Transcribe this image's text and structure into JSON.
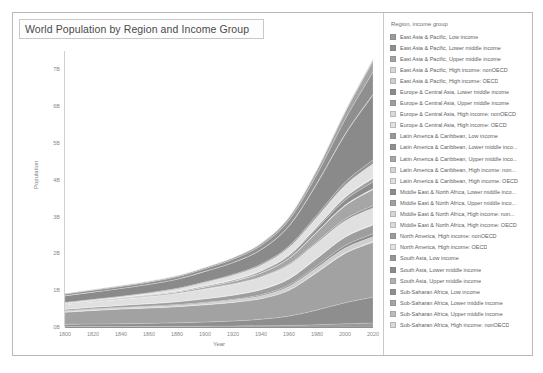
{
  "chart_data": {
    "type": "area",
    "stacked": true,
    "title": "World Population by Region and Income Group",
    "xlabel": "Year",
    "ylabel": "Population",
    "xlim": [
      1800,
      2020
    ],
    "ylim": [
      0,
      7500000000
    ],
    "grid": false,
    "legend_position": "right",
    "legend_title": "Region, income group",
    "x_ticks": [
      "1800",
      "1820",
      "1840",
      "1860",
      "1880",
      "1900",
      "1920",
      "1940",
      "1960",
      "1980",
      "2000",
      "2020"
    ],
    "x_tick_values": [
      1800,
      1820,
      1840,
      1860,
      1880,
      1900,
      1920,
      1940,
      1960,
      1980,
      2000,
      2020
    ],
    "y_ticks": [
      "0B",
      "1B",
      "2B",
      "3B",
      "4B",
      "5B",
      "6B",
      "7B"
    ],
    "y_tick_values": [
      0,
      1000000000,
      2000000000,
      3000000000,
      4000000000,
      5000000000,
      6000000000,
      7000000000
    ],
    "x": [
      1800,
      1820,
      1840,
      1860,
      1880,
      1900,
      1920,
      1940,
      1960,
      1980,
      2000,
      2020
    ],
    "series": [
      {
        "name": "East Asia & Pacific, Low income",
        "color": "#9a9a9a",
        "values": [
          12000000,
          13500000,
          15000000,
          17000000,
          19000000,
          22000000,
          26000000,
          32000000,
          42000000,
          62000000,
          88000000,
          112000000
        ]
      },
      {
        "name": "East Asia & Pacific, Lower middle income",
        "color": "#8e8e8e",
        "values": [
          60000000,
          66000000,
          73000000,
          82000000,
          94000000,
          112000000,
          138000000,
          178000000,
          255000000,
          400000000,
          570000000,
          700000000
        ]
      },
      {
        "name": "East Asia & Pacific, Upper middle income",
        "color": "#a2a2a2",
        "values": [
          330000000,
          370000000,
          400000000,
          420000000,
          440000000,
          470000000,
          505000000,
          560000000,
          700000000,
          1020000000,
          1340000000,
          1490000000
        ]
      },
      {
        "name": "East Asia & Pacific, High income: nonOECD",
        "color": "#d8d8d8",
        "values": [
          2000000,
          2300000,
          2600000,
          3000000,
          3600000,
          4400000,
          5500000,
          7000000,
          10000000,
          15000000,
          20000000,
          24000000
        ]
      },
      {
        "name": "East Asia & Pacific, High income: OECD",
        "color": "#cfcfcf",
        "values": [
          30000000,
          32000000,
          33000000,
          34000000,
          37000000,
          45000000,
          56000000,
          73000000,
          94000000,
          117000000,
          127000000,
          126000000
        ]
      },
      {
        "name": "Europe & Central Asia, Lower middle income",
        "color": "#8b8b8b",
        "values": [
          8000000,
          9500000,
          11000000,
          13000000,
          15500000,
          19000000,
          23000000,
          29000000,
          38000000,
          52000000,
          68000000,
          82000000
        ]
      },
      {
        "name": "Europe & Central Asia, Upper middle income",
        "color": "#9e9e9e",
        "values": [
          38000000,
          44000000,
          52000000,
          62000000,
          74000000,
          92000000,
          108000000,
          133000000,
          165000000,
          200000000,
          225000000,
          240000000
        ]
      },
      {
        "name": "Europe & Central Asia, High income: nonOECD",
        "color": "#dadada",
        "values": [
          4000000,
          4600000,
          5200000,
          6000000,
          7000000,
          8400000,
          9500000,
          11000000,
          13000000,
          15500000,
          17000000,
          18000000
        ]
      },
      {
        "name": "Europe & Central Asia, High income: OECD",
        "color": "#e0e0e0",
        "values": [
          130000000,
          146000000,
          166000000,
          190000000,
          220000000,
          260000000,
          290000000,
          330000000,
          370000000,
          405000000,
          425000000,
          440000000
        ]
      },
      {
        "name": "Latin America & Caribbean, Low income",
        "color": "#999999",
        "values": [
          800000,
          900000,
          1000000,
          1200000,
          1400000,
          1700000,
          2100000,
          2800000,
          4000000,
          6000000,
          8500000,
          11000000
        ]
      },
      {
        "name": "Latin America & Caribbean, Lower middle inco...",
        "color": "#909090",
        "values": [
          3000000,
          3400000,
          3900000,
          4600000,
          5600000,
          7000000,
          9000000,
          13000000,
          20000000,
          32000000,
          45000000,
          56000000
        ]
      },
      {
        "name": "Latin America & Caribbean, Upper middle inco...",
        "color": "#a6a6a6",
        "values": [
          15000000,
          18000000,
          22000000,
          28000000,
          36000000,
          48000000,
          68000000,
          100000000,
          155000000,
          255000000,
          360000000,
          440000000
        ]
      },
      {
        "name": "Latin America & Caribbean, High income: non...",
        "color": "#d5d5d5",
        "values": [
          500000,
          600000,
          700000,
          850000,
          1050000,
          1300000,
          1700000,
          2300000,
          3200000,
          4600000,
          6200000,
          7400000
        ]
      },
      {
        "name": "Latin America & Caribbean, High income: OECD",
        "color": "#dedede",
        "values": [
          700000,
          850000,
          1000000,
          1300000,
          1700000,
          2400000,
          3500000,
          5200000,
          7800000,
          11500000,
          15500000,
          19000000
        ]
      },
      {
        "name": "Middle East & North Africa, Lower middle inco...",
        "color": "#8c8c8c",
        "values": [
          10000000,
          11000000,
          12500000,
          14500000,
          17000000,
          21000000,
          26000000,
          35000000,
          52000000,
          85000000,
          130000000,
          175000000
        ]
      },
      {
        "name": "Middle East & North Africa, Upper middle inco...",
        "color": "#a0a0a0",
        "values": [
          6000000,
          6700000,
          7500000,
          8600000,
          10000000,
          12500000,
          15500000,
          21000000,
          31000000,
          50000000,
          76000000,
          100000000
        ]
      },
      {
        "name": "Middle East & North Africa, High income: non...",
        "color": "#d7d7d7",
        "values": [
          400000,
          450000,
          520000,
          600000,
          720000,
          900000,
          1200000,
          1700000,
          2600000,
          5000000,
          10000000,
          17000000
        ]
      },
      {
        "name": "Middle East & North Africa, High income: OECD",
        "color": "#dcdcdc",
        "values": [
          300000,
          340000,
          390000,
          450000,
          540000,
          680000,
          870000,
          1200000,
          1800000,
          2800000,
          4000000,
          5200000
        ]
      },
      {
        "name": "North America, High income: nonOECD",
        "color": "#9c9c9c",
        "values": [
          200000,
          240000,
          290000,
          350000,
          430000,
          540000,
          700000,
          950000,
          1300000,
          1800000,
          2300000,
          2700000
        ]
      },
      {
        "name": "North America, High income: OECD",
        "color": "#e2e2e2",
        "values": [
          7000000,
          10500000,
          17500000,
          32000000,
          51000000,
          82000000,
          117000000,
          144000000,
          199000000,
          252000000,
          313000000,
          368000000
        ]
      },
      {
        "name": "South Asia, Low income",
        "color": "#969696",
        "values": [
          10000000,
          11000000,
          12500000,
          14000000,
          16000000,
          19000000,
          23000000,
          29000000,
          39000000,
          58000000,
          85000000,
          110000000
        ]
      },
      {
        "name": "South Asia, Lower middle income",
        "color": "#8a8a8a",
        "values": [
          180000000,
          195000000,
          210000000,
          225000000,
          245000000,
          280000000,
          320000000,
          390000000,
          540000000,
          850000000,
          1290000000,
          1760000000
        ]
      },
      {
        "name": "South Asia, Upper middle income",
        "color": "#b0b0b0",
        "values": [
          1500000,
          1700000,
          1900000,
          2200000,
          2600000,
          3200000,
          4000000,
          5200000,
          7500000,
          12000000,
          18000000,
          23000000
        ]
      },
      {
        "name": "Sub-Saharan Africa, Low income",
        "color": "#8f8f8f",
        "values": [
          45000000,
          48000000,
          52000000,
          57000000,
          63000000,
          73000000,
          88000000,
          112000000,
          155000000,
          240000000,
          390000000,
          600000000
        ]
      },
      {
        "name": "Sub-Saharan Africa, Lower middle income",
        "color": "#a4a4a4",
        "values": [
          20000000,
          21500000,
          23500000,
          26000000,
          29000000,
          34000000,
          41000000,
          53000000,
          74000000,
          115000000,
          190000000,
          300000000
        ]
      },
      {
        "name": "Sub-Saharan Africa, Upper middle income",
        "color": "#bdbdbd",
        "values": [
          3000000,
          3300000,
          3700000,
          4200000,
          5000000,
          6200000,
          8000000,
          11000000,
          16000000,
          26000000,
          40000000,
          58000000
        ]
      },
      {
        "name": "Sub-Saharan Africa, High income: nonOECD",
        "color": "#d9d9d9",
        "values": [
          80000,
          90000,
          105000,
          125000,
          150000,
          190000,
          250000,
          340000,
          500000,
          750000,
          1050000,
          1350000
        ]
      }
    ]
  },
  "legend": {
    "title": "Region, income group",
    "items": [
      {
        "label": "East Asia & Pacific, Low income",
        "color": "#9a9a9a"
      },
      {
        "label": "East Asia & Pacific, Lower middle income",
        "color": "#8e8e8e"
      },
      {
        "label": "East Asia & Pacific, Upper middle income",
        "color": "#a2a2a2"
      },
      {
        "label": "East Asia & Pacific, High income: nonOECD",
        "color": "#d8d8d8"
      },
      {
        "label": "East Asia & Pacific, High income: OECD",
        "color": "#cfcfcf"
      },
      {
        "label": "Europe & Central Asia, Lower middle income",
        "color": "#8b8b8b"
      },
      {
        "label": "Europe & Central Asia, Upper middle income",
        "color": "#9e9e9e"
      },
      {
        "label": "Europe & Central Asia, High income: nonOECD",
        "color": "#dadada"
      },
      {
        "label": "Europe & Central Asia, High income: OECD",
        "color": "#e0e0e0"
      },
      {
        "label": "Latin America & Caribbean, Low income",
        "color": "#999999"
      },
      {
        "label": "Latin America & Caribbean, Lower middle inco...",
        "color": "#909090"
      },
      {
        "label": "Latin America & Caribbean, Upper middle inco...",
        "color": "#a6a6a6"
      },
      {
        "label": "Latin America & Caribbean, High income: non...",
        "color": "#d5d5d5"
      },
      {
        "label": "Latin America & Caribbean, High income: OECD",
        "color": "#dedede"
      },
      {
        "label": "Middle East & North Africa, Lower middle inco...",
        "color": "#8c8c8c"
      },
      {
        "label": "Middle East & North Africa, Upper middle inco...",
        "color": "#a0a0a0"
      },
      {
        "label": "Middle East & North Africa, High income: non...",
        "color": "#d7d7d7"
      },
      {
        "label": "Middle East & North Africa, High income: OECD",
        "color": "#dcdcdc"
      },
      {
        "label": "North America, High income: nonOECD",
        "color": "#9c9c9c"
      },
      {
        "label": "North America, High income: OECD",
        "color": "#e2e2e2"
      },
      {
        "label": "South Asia, Low income",
        "color": "#969696"
      },
      {
        "label": "South Asia, Lower middle income",
        "color": "#8a8a8a"
      },
      {
        "label": "South Asia, Upper middle income",
        "color": "#b0b0b0"
      },
      {
        "label": "Sub-Saharan Africa, Low income",
        "color": "#8f8f8f"
      },
      {
        "label": "Sub-Saharan Africa, Lower middle income",
        "color": "#a4a4a4"
      },
      {
        "label": "Sub-Saharan Africa, Upper middle income",
        "color": "#bdbdbd"
      },
      {
        "label": "Sub-Saharan Africa, High income: nonOECD",
        "color": "#d9d9d9"
      }
    ]
  }
}
